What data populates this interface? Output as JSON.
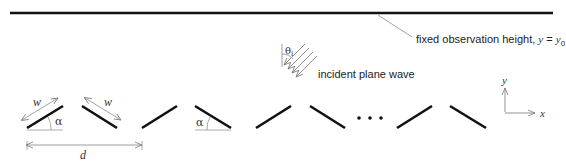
{
  "labels": {
    "observation": "fixed observation height, ",
    "observation_eq_y": "y",
    "observation_eq_sign": " = ",
    "observation_eq_y0": "y",
    "observation_eq_sub": "0",
    "incident": "incident plane wave",
    "theta": "θ",
    "theta_sub": "i",
    "alpha1": "α",
    "alpha2": "α",
    "w1": "w",
    "w2": "w",
    "d": "d",
    "axis_x": "x",
    "axis_y": "y",
    "ellipsis": "•  •  •"
  },
  "colors": {
    "strip": "#111111",
    "thin": "#777777",
    "text": "#222222"
  }
}
